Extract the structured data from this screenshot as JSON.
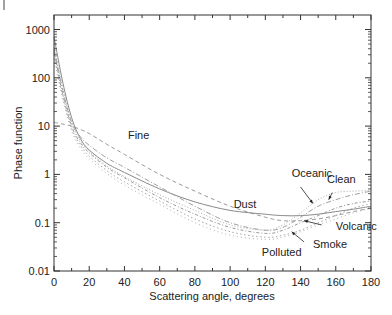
{
  "chart_data": {
    "type": "line",
    "title": "",
    "xlabel": "Scattering angle, degrees",
    "ylabel": "Phase function",
    "xlim": [
      0,
      180
    ],
    "ylim": [
      0.01,
      1000
    ],
    "yscale": "log",
    "grid": false,
    "legend": "inline annotations",
    "x_ticks": [
      "0",
      "20",
      "40",
      "60",
      "80",
      "100",
      "120",
      "140",
      "160",
      "180"
    ],
    "y_ticks": [
      "0.01",
      "0.1",
      "1",
      "10",
      "100",
      "1000"
    ],
    "x": [
      0,
      5,
      10,
      15,
      20,
      30,
      40,
      60,
      80,
      100,
      120,
      130,
      140,
      150,
      160,
      170,
      180
    ],
    "series": [
      {
        "name": "Fine",
        "style": "dash",
        "values": [
          12,
          11,
          10,
          8.5,
          7,
          4.2,
          2.6,
          1.0,
          0.45,
          0.22,
          0.13,
          0.11,
          0.11,
          0.12,
          0.14,
          0.17,
          0.2
        ]
      },
      {
        "name": "Dust",
        "style": "solid",
        "values": [
          700,
          80,
          15,
          5.5,
          3.2,
          1.7,
          1.1,
          0.5,
          0.27,
          0.18,
          0.15,
          0.14,
          0.14,
          0.15,
          0.17,
          0.19,
          0.22
        ]
      },
      {
        "name": "Oceanic",
        "style": "dot",
        "values": [
          500,
          60,
          12,
          5,
          3,
          1.5,
          0.9,
          0.38,
          0.18,
          0.09,
          0.07,
          0.09,
          0.16,
          0.3,
          0.42,
          0.45,
          0.46
        ]
      },
      {
        "name": "Clean",
        "style": "dashdot",
        "values": [
          400,
          55,
          12,
          6,
          4,
          2.2,
          1.4,
          0.55,
          0.22,
          0.1,
          0.07,
          0.08,
          0.13,
          0.22,
          0.3,
          0.38,
          0.45
        ]
      },
      {
        "name": "Volcanic",
        "style": "dashdot2",
        "values": [
          350,
          45,
          10,
          4.5,
          2.8,
          1.4,
          0.85,
          0.33,
          0.15,
          0.08,
          0.06,
          0.07,
          0.1,
          0.14,
          0.2,
          0.25,
          0.28
        ]
      },
      {
        "name": "Smoke",
        "style": "dot2",
        "values": [
          300,
          40,
          9,
          4,
          2.4,
          1.2,
          0.7,
          0.28,
          0.12,
          0.065,
          0.05,
          0.055,
          0.07,
          0.1,
          0.14,
          0.2,
          0.25
        ]
      },
      {
        "name": "Polluted",
        "style": "dot3",
        "values": [
          250,
          35,
          8,
          3.5,
          2.1,
          1.05,
          0.6,
          0.24,
          0.1,
          0.055,
          0.045,
          0.05,
          0.065,
          0.09,
          0.12,
          0.16,
          0.2
        ]
      }
    ],
    "annotations": [
      {
        "text": "Fine",
        "x": 42,
        "y": 5.5
      },
      {
        "text": "Oceanic",
        "x": 135,
        "y": 0.9
      },
      {
        "text": "Clean",
        "x": 155,
        "y": 0.65
      },
      {
        "text": "Dust",
        "x": 102,
        "y": 0.2
      },
      {
        "text": "Volcanic",
        "x": 160,
        "y": 0.07
      },
      {
        "text": "Smoke",
        "x": 147,
        "y": 0.03
      },
      {
        "text": "Polluted",
        "x": 118,
        "y": 0.02
      }
    ]
  }
}
